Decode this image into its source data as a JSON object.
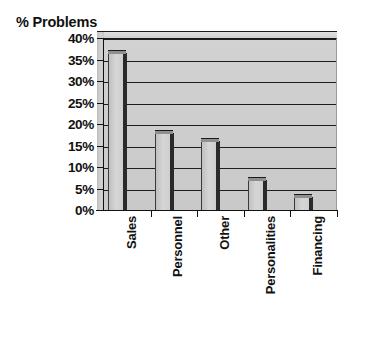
{
  "chart_data": {
    "type": "bar",
    "title": "% Problems",
    "xlabel": "",
    "ylabel": "",
    "categories": [
      "Sales",
      "Personnel",
      "Other",
      "Personalities",
      "Financing"
    ],
    "values": [
      36.5,
      18,
      16,
      7,
      3
    ],
    "ylim": [
      0,
      40
    ],
    "yticks": [
      0,
      5,
      10,
      15,
      20,
      25,
      30,
      35,
      40
    ],
    "ytick_labels": [
      "0%",
      "5%",
      "10%",
      "15%",
      "20%",
      "25%",
      "30%",
      "35%",
      "40%"
    ],
    "grid": true,
    "legend": false,
    "orientation": "vertical",
    "style": "3d-grayscale",
    "colors": {
      "plot_background": "#cccccc",
      "bar_fill": "#d0d0d0",
      "bar_edge": "#1a1a1a",
      "gridline": "#1d1d1d",
      "axis": "#111111",
      "text": "#111111",
      "page_background": "#ffffff"
    }
  }
}
